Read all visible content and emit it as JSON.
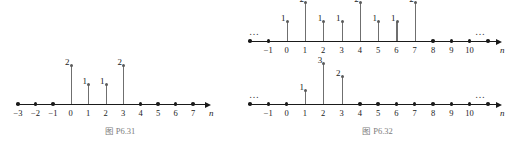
{
  "page": {
    "background_color": "#ffffff",
    "axis_color": "#1a1a1a",
    "stem_color": "#6f6f6f",
    "caption_color": "#7d7d7d"
  },
  "figures": [
    {
      "id": "p6-31",
      "caption": "图 P6.31",
      "plots": [
        {
          "id": "p6-31-plot",
          "axis_label": "n",
          "left_ellipsis": "",
          "right_ellipsis": "",
          "tick_labels": [
            "−3",
            "−2",
            "−1",
            "0",
            "1",
            "2",
            "3",
            "4",
            "5",
            "6",
            "7"
          ],
          "tick_n": [
            -3,
            -2,
            -1,
            0,
            1,
            2,
            3,
            4,
            5,
            6,
            7
          ],
          "zero_dots_n": [
            -3,
            -2,
            -1,
            4,
            5,
            6,
            7
          ],
          "stems": [
            {
              "n": 0,
              "value": 2,
              "label": "2"
            },
            {
              "n": 1,
              "value": 1,
              "label": "1"
            },
            {
              "n": 2,
              "value": 1,
              "label": "1"
            },
            {
              "n": 3,
              "value": 2,
              "label": "2"
            }
          ]
        }
      ]
    },
    {
      "id": "p6-32",
      "caption": "图 P6.32",
      "plots": [
        {
          "id": "p6-32-plot-top",
          "axis_label": "n",
          "left_ellipsis": "…",
          "right_ellipsis": "…",
          "tick_labels": [
            "−1",
            "0",
            "1",
            "2",
            "3",
            "4",
            "5",
            "6",
            "7",
            "8",
            "9",
            "10"
          ],
          "tick_n": [
            -1,
            0,
            1,
            2,
            3,
            4,
            5,
            6,
            7,
            8,
            9,
            10
          ],
          "zero_dots_n": [
            -2,
            -1,
            8,
            9,
            10,
            11
          ],
          "stems": [
            {
              "n": 0,
              "value": 1,
              "label": "1"
            },
            {
              "n": 1,
              "value": 2,
              "label": "2"
            },
            {
              "n": 2,
              "value": 1,
              "label": "1"
            },
            {
              "n": 3,
              "value": 1,
              "label": "1"
            },
            {
              "n": 4,
              "value": 2,
              "label": "2"
            },
            {
              "n": 5,
              "value": 1,
              "label": "1"
            },
            {
              "n": 6,
              "value": 1,
              "label": "1"
            },
            {
              "n": 7,
              "value": 2,
              "label": "2"
            }
          ]
        },
        {
          "id": "p6-32-plot-bottom",
          "axis_label": "n",
          "left_ellipsis": "…",
          "right_ellipsis": "…",
          "tick_labels": [
            "−1",
            "0",
            "1",
            "2",
            "3",
            "4",
            "5",
            "6",
            "7",
            "8",
            "9",
            "10"
          ],
          "tick_n": [
            -1,
            0,
            1,
            2,
            3,
            4,
            5,
            6,
            7,
            8,
            9,
            10
          ],
          "zero_dots_n": [
            -2,
            -1,
            0,
            4,
            5,
            6,
            7,
            8,
            9,
            10,
            11
          ],
          "stems": [
            {
              "n": 1,
              "value": 1,
              "label": "1"
            },
            {
              "n": 2,
              "value": 3,
              "label": "3"
            },
            {
              "n": 3,
              "value": 2,
              "label": "2"
            }
          ]
        }
      ]
    }
  ],
  "chart_data": {
    "type": "scatter",
    "title": "",
    "xlabel": "n",
    "ylabel": "",
    "charts": [
      {
        "name": "图 P6.31",
        "type": "stem",
        "x": [
          -3,
          -2,
          -1,
          0,
          1,
          2,
          3,
          4,
          5,
          6,
          7
        ],
        "y": [
          0,
          0,
          0,
          2,
          1,
          1,
          2,
          0,
          0,
          0,
          0
        ],
        "xlabel": "n",
        "xlim": [
          -3.6,
          7.9
        ],
        "ylim": [
          0,
          2
        ],
        "grid": false
      },
      {
        "name": "图 P6.32 (top)",
        "type": "stem",
        "x": [
          -2,
          -1,
          0,
          1,
          2,
          3,
          4,
          5,
          6,
          7,
          8,
          9,
          10,
          11
        ],
        "y": [
          0,
          0,
          1,
          2,
          1,
          1,
          2,
          1,
          1,
          2,
          0,
          0,
          0,
          0
        ],
        "xlabel": "n",
        "xlim": [
          -2.8,
          11.6
        ],
        "ylim": [
          0,
          2
        ],
        "grid": false
      },
      {
        "name": "图 P6.32 (bottom)",
        "type": "stem",
        "x": [
          -2,
          -1,
          0,
          1,
          2,
          3,
          4,
          5,
          6,
          7,
          8,
          9,
          10,
          11
        ],
        "y": [
          0,
          0,
          0,
          1,
          3,
          2,
          0,
          0,
          0,
          0,
          0,
          0,
          0,
          0
        ],
        "xlabel": "n",
        "xlim": [
          -2.8,
          11.6
        ],
        "ylim": [
          0,
          3
        ],
        "grid": false
      }
    ]
  }
}
